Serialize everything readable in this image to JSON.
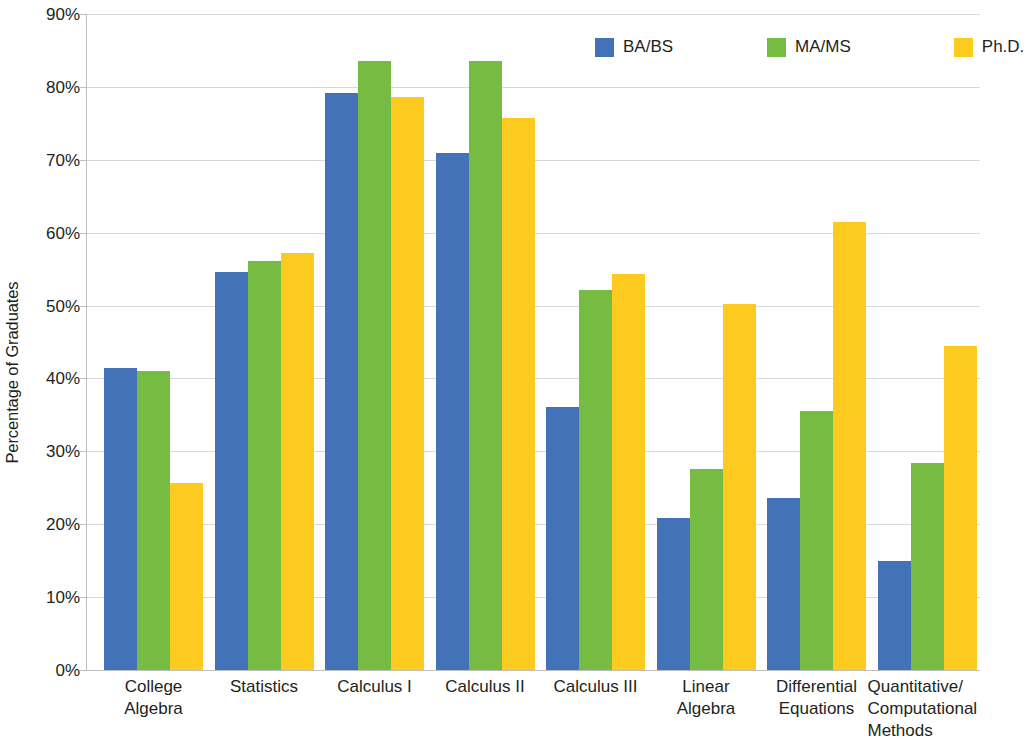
{
  "chart_data": {
    "type": "bar",
    "title": "",
    "subtitle": "",
    "xlabel": "",
    "ylabel": "Percentage of Graduates",
    "ylim": [
      0,
      90
    ],
    "ytick_step": 10,
    "ytick_labels": [
      "90%",
      "80%",
      "70%",
      "60%",
      "50%",
      "40%",
      "30%",
      "20%",
      "10%",
      "0%"
    ],
    "ytick_values": [
      90,
      80,
      70,
      60,
      50,
      40,
      30,
      20,
      10,
      0
    ],
    "grid": "horizontal",
    "legend_position": "top-right",
    "value_format": "percent",
    "categories": [
      "College\nAlgebra",
      "Statistics",
      "Calculus I",
      "Calculus II",
      "Calculus III",
      "Linear\nAlgebra",
      "Differential\nEquations",
      "Quantitative/\nComputational\nMethods"
    ],
    "series": [
      {
        "name": "BA/BS",
        "color": "#4472b8",
        "values": [
          41.5,
          54.6,
          79.2,
          71.0,
          36.1,
          20.8,
          23.6,
          14.9
        ]
      },
      {
        "name": "MA/MS",
        "color": "#76bc43",
        "values": [
          41.0,
          56.1,
          83.6,
          83.6,
          52.1,
          27.6,
          35.5,
          28.4
        ]
      },
      {
        "name": "Ph.D.",
        "color": "#fdcb1f",
        "values": [
          25.7,
          57.2,
          78.6,
          75.7,
          54.4,
          50.2,
          61.5,
          44.4
        ]
      }
    ],
    "colors": {
      "blue": "#4472b8",
      "green": "#76bc43",
      "yellow": "#fdcb1f",
      "gridline": "#d9d9d9",
      "axis": "#bfbfbf",
      "text": "#231f20",
      "background": "#ffffff"
    }
  },
  "legend": {
    "entries": [
      {
        "label": "BA/BS",
        "color": "#4472b8",
        "icon": "legend-swatch-blue"
      },
      {
        "label": "MA/MS",
        "color": "#76bc43",
        "icon": "legend-swatch-green"
      },
      {
        "label": "Ph.D.",
        "color": "#fdcb1f",
        "icon": "legend-swatch-yellow"
      }
    ]
  }
}
